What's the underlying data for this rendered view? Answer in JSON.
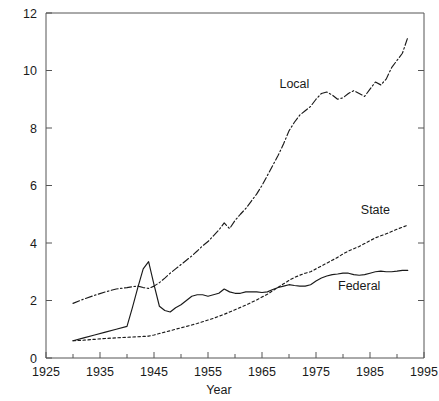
{
  "chart_data": {
    "type": "line",
    "title": "",
    "subtitle": "",
    "xlabel": "Year",
    "ylabel": "",
    "xlim": [
      1925,
      1995
    ],
    "ylim": [
      0,
      12
    ],
    "grid": false,
    "legend_position": "inline-annotations",
    "xticks": [
      1925,
      1935,
      1945,
      1955,
      1965,
      1975,
      1985,
      1995
    ],
    "xticklabels": [
      "1925",
      "1935",
      "1945",
      "1955",
      "1965",
      "1975",
      "1985",
      "1995"
    ],
    "xminorticks": [
      1930,
      1940,
      1950,
      1960,
      1970,
      1980,
      1990
    ],
    "yticks": [
      0,
      2,
      4,
      6,
      8,
      10,
      12
    ],
    "yticklabels": [
      "0",
      "2",
      "4",
      "6",
      "8",
      "10",
      "12"
    ],
    "x": [
      1930,
      1932,
      1934,
      1936,
      1938,
      1940,
      1941,
      1942,
      1943,
      1944,
      1945,
      1946,
      1947,
      1948,
      1949,
      1950,
      1951,
      1952,
      1953,
      1954,
      1955,
      1956,
      1957,
      1958,
      1959,
      1960,
      1961,
      1962,
      1963,
      1964,
      1965,
      1966,
      1967,
      1968,
      1969,
      1970,
      1971,
      1972,
      1973,
      1974,
      1975,
      1976,
      1977,
      1978,
      1979,
      1980,
      1981,
      1982,
      1983,
      1984,
      1985,
      1986,
      1987,
      1988,
      1989,
      1990,
      1991,
      1992
    ],
    "series": [
      {
        "name": "Local",
        "label": "Local",
        "style": "dash-dot",
        "values": [
          1.9,
          2.05,
          2.18,
          2.3,
          2.4,
          2.45,
          2.48,
          2.5,
          2.45,
          2.42,
          2.5,
          2.62,
          2.78,
          2.95,
          3.1,
          3.25,
          3.4,
          3.55,
          3.72,
          3.9,
          4.05,
          4.25,
          4.45,
          4.7,
          4.5,
          4.78,
          5.0,
          5.2,
          5.45,
          5.7,
          6.0,
          6.35,
          6.7,
          7.05,
          7.45,
          7.9,
          8.2,
          8.45,
          8.6,
          8.75,
          9.0,
          9.2,
          9.25,
          9.15,
          9.0,
          9.05,
          9.2,
          9.3,
          9.2,
          9.1,
          9.35,
          9.6,
          9.5,
          9.7,
          10.1,
          10.35,
          10.6,
          11.15
        ]
      },
      {
        "name": "State",
        "label": "State",
        "style": "dotted",
        "values": [
          0.6,
          0.62,
          0.65,
          0.68,
          0.7,
          0.72,
          0.73,
          0.74,
          0.75,
          0.76,
          0.8,
          0.85,
          0.9,
          0.95,
          1.0,
          1.05,
          1.1,
          1.15,
          1.2,
          1.26,
          1.32,
          1.38,
          1.45,
          1.52,
          1.6,
          1.68,
          1.76,
          1.84,
          1.93,
          2.02,
          2.12,
          2.22,
          2.34,
          2.46,
          2.58,
          2.7,
          2.8,
          2.88,
          2.95,
          3.0,
          3.1,
          3.2,
          3.3,
          3.4,
          3.5,
          3.62,
          3.72,
          3.8,
          3.88,
          3.98,
          4.08,
          4.18,
          4.25,
          4.32,
          4.4,
          4.48,
          4.55,
          4.62
        ]
      },
      {
        "name": "Federal",
        "label": "Federal",
        "style": "solid",
        "values": [
          0.6,
          0.7,
          0.8,
          0.9,
          1.0,
          1.1,
          1.75,
          2.45,
          3.1,
          3.35,
          2.55,
          1.8,
          1.65,
          1.6,
          1.75,
          1.85,
          2.0,
          2.15,
          2.2,
          2.2,
          2.15,
          2.2,
          2.25,
          2.4,
          2.3,
          2.25,
          2.25,
          2.3,
          2.3,
          2.3,
          2.28,
          2.3,
          2.38,
          2.45,
          2.5,
          2.55,
          2.52,
          2.5,
          2.5,
          2.55,
          2.68,
          2.78,
          2.85,
          2.9,
          2.92,
          2.95,
          2.95,
          2.9,
          2.88,
          2.9,
          2.95,
          3.0,
          3.02,
          3.0,
          3.0,
          3.02,
          3.05,
          3.05
        ]
      }
    ],
    "annotations": [
      {
        "text": "Local",
        "x": 1971,
        "y": 9.4
      },
      {
        "text": "State",
        "x": 1986,
        "y": 5.0
      },
      {
        "text": "Federal",
        "x": 1983,
        "y": 2.35
      }
    ],
    "colors": {
      "line": "#1a1a1a",
      "axis": "#555555",
      "background": "#ffffff",
      "text": "#1a1a1a"
    }
  }
}
